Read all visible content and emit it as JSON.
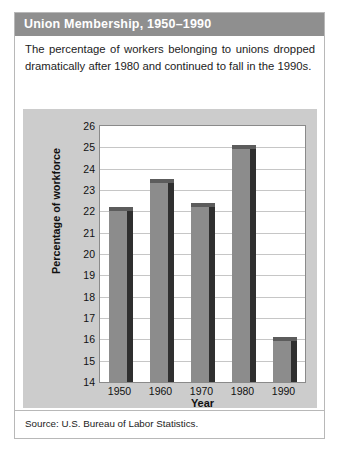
{
  "figure": {
    "title": "Union Membership, 1950–1990",
    "caption": "The percentage of workers belonging to unions dropped dramatically after 1980 and continued to fall in the 1990s.",
    "source": "Source: U.S. Bureau of Labor Statistics."
  },
  "colors": {
    "title_bar": "#8f8f8f",
    "panel_background": "#cccccc",
    "plot_background": "#ffffff",
    "bar_face": "#8c8c8c",
    "bar_shadow": "#2f2f2f",
    "gridline": "#c6c6c6",
    "text": "#101010"
  },
  "chart_data": {
    "type": "bar",
    "title": "Union Membership, 1950–1990",
    "xlabel": "Year",
    "ylabel": "Percentage of workforce",
    "categories": [
      "1950",
      "1960",
      "1970",
      "1980",
      "1990"
    ],
    "values": [
      22.2,
      23.5,
      22.4,
      25.1,
      16.1
    ],
    "ylim": [
      14,
      26
    ],
    "ytick_step": 1,
    "yticks": [
      26,
      25,
      24,
      23,
      22,
      21,
      20,
      19,
      18,
      17,
      16,
      15,
      14
    ],
    "grid": true,
    "legend": null,
    "annotations": []
  }
}
